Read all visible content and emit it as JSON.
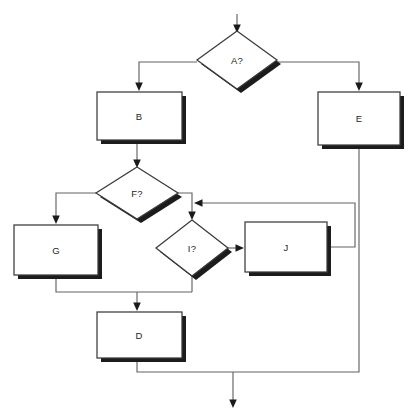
{
  "diagram": {
    "kind": "flowchart",
    "width": 414,
    "height": 420,
    "background_color": "#ffffff",
    "connector_color": "#636363",
    "shape_border_color": "#3a3a3a",
    "shape_fill_color": "#ffffff",
    "shadow_color": "#1c1c1c",
    "label_color": "#262626",
    "nodes": [
      {
        "id": "A",
        "label": "A?",
        "shape": "decision",
        "cx": 237,
        "cy": 60,
        "rx": 40,
        "ry": 29
      },
      {
        "id": "B",
        "label": "B",
        "shape": "process",
        "x": 97,
        "y": 92,
        "w": 85,
        "h": 48
      },
      {
        "id": "E",
        "label": "E",
        "shape": "process",
        "x": 318,
        "y": 92,
        "w": 82,
        "h": 53
      },
      {
        "id": "F",
        "label": "F?",
        "shape": "decision",
        "cx": 137,
        "cy": 193,
        "rx": 41,
        "ry": 26
      },
      {
        "id": "G",
        "label": "G",
        "shape": "process",
        "x": 14,
        "y": 225,
        "w": 84,
        "h": 50
      },
      {
        "id": "I",
        "label": "I?",
        "shape": "decision",
        "cx": 192,
        "cy": 248,
        "rx": 36,
        "ry": 28
      },
      {
        "id": "J",
        "label": "J",
        "shape": "process",
        "x": 245,
        "y": 222,
        "w": 82,
        "h": 50
      },
      {
        "id": "D",
        "label": "D",
        "shape": "process",
        "x": 97,
        "y": 312,
        "w": 85,
        "h": 46
      }
    ],
    "edges": [
      {
        "id": "entry-to-A",
        "from": "start",
        "to": "A",
        "arrow": true
      },
      {
        "id": "A-to-B",
        "from": "A",
        "to": "B",
        "arrow": true
      },
      {
        "id": "A-to-E",
        "from": "A",
        "to": "E",
        "arrow": true
      },
      {
        "id": "B-to-F",
        "from": "B",
        "to": "F",
        "arrow": true
      },
      {
        "id": "F-to-G",
        "from": "F",
        "to": "G",
        "arrow": true
      },
      {
        "id": "F-to-I",
        "from": "F",
        "to": "I",
        "arrow": true
      },
      {
        "id": "I-to-J",
        "from": "I",
        "to": "J",
        "arrow": true
      },
      {
        "id": "J-loop-to-I",
        "from": "J",
        "to": "I",
        "arrow": true
      },
      {
        "id": "G-to-D",
        "from": "G",
        "to": "D",
        "arrow": true
      },
      {
        "id": "I-to-D",
        "from": "I",
        "to": "D",
        "arrow": true
      },
      {
        "id": "D-to-exit",
        "from": "D",
        "to": "end",
        "arrow": true
      },
      {
        "id": "E-to-exit",
        "from": "E",
        "to": "end",
        "arrow": false
      }
    ]
  }
}
